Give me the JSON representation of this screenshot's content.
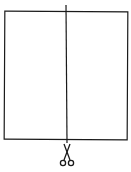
{
  "diagram": {
    "title": "",
    "shapes": [
      {
        "type": "rectangle",
        "name": "paper-sheet",
        "x": 4,
        "y": 11,
        "width": 124,
        "height": 129
      },
      {
        "type": "line",
        "name": "cut-line",
        "x1": 66,
        "y1": 5,
        "x2": 67,
        "y2": 143
      },
      {
        "type": "icon",
        "name": "scissors-icon",
        "cx": 67,
        "cy": 156
      }
    ],
    "colors": {
      "stroke": "#1a1a1a",
      "background": "#ffffff"
    }
  }
}
